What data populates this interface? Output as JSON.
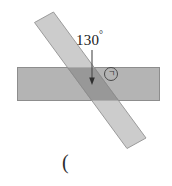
{
  "figure": {
    "title": "",
    "angle_label": "130",
    "degree_symbol": "°",
    "region_mark": "ㄱ",
    "caption": "(",
    "colors": {
      "horizontal_band_fill": "#b3b3b3",
      "horizontal_band_stroke": "#8f8f8f",
      "diagonal_strip_fill": "#c6c6c6",
      "diagonal_strip_stroke": "#9a9a9a",
      "overlap_fill": "#9a9a9a",
      "arrow_stroke": "#4a4a4a",
      "text_color": "#1a1a1a",
      "background": "#ffffff"
    },
    "geometry": {
      "horizontal_band": {
        "x": 17,
        "y": 67,
        "width": 143,
        "height": 34
      },
      "diagonal_strip": {
        "angle_degrees": 130,
        "width": 24,
        "top_end_x": 47,
        "top_end_y": 17,
        "bottom_end_x": 133,
        "bottom_end_y": 140
      },
      "arrow": {
        "from_x": 92,
        "from_y": 50,
        "to_x": 92,
        "to_y": 84
      }
    }
  }
}
